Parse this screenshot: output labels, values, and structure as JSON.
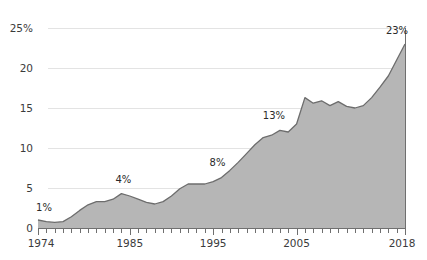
{
  "chart_data": {
    "type": "area",
    "title": "",
    "subtitle": "",
    "xlabel": "",
    "ylabel": "",
    "xlim": [
      1974,
      2018
    ],
    "ylim": [
      0,
      25
    ],
    "grid": true,
    "legend_position": "none",
    "y_ticks": [
      0,
      5,
      10,
      15,
      20,
      25
    ],
    "y_tick_labels": [
      "0",
      "5",
      "10",
      "15",
      "20",
      "25%"
    ],
    "x_tick_labels": [
      "1974",
      "1985",
      "1995",
      "2005",
      "2018"
    ],
    "x_tick_values": [
      1974,
      1985,
      1995,
      2005,
      2018
    ],
    "minor_tick_interval": 1,
    "series": [
      {
        "name": "value",
        "x": [
          1974,
          1975,
          1976,
          1977,
          1978,
          1979,
          1980,
          1981,
          1982,
          1983,
          1984,
          1985,
          1986,
          1987,
          1988,
          1989,
          1990,
          1991,
          1992,
          1993,
          1994,
          1995,
          1996,
          1997,
          1998,
          1999,
          2000,
          2001,
          2002,
          2003,
          2004,
          2005,
          2006,
          2007,
          2008,
          2009,
          2010,
          2011,
          2012,
          2013,
          2014,
          2015,
          2016,
          2017,
          2018
        ],
        "values": [
          1.0,
          0.8,
          0.7,
          0.8,
          1.4,
          2.2,
          2.9,
          3.3,
          3.3,
          3.6,
          4.3,
          4.0,
          3.6,
          3.2,
          3.0,
          3.3,
          4.0,
          4.9,
          5.5,
          5.5,
          5.5,
          5.8,
          6.3,
          7.2,
          8.2,
          9.3,
          10.4,
          11.3,
          11.6,
          12.2,
          12.0,
          13.0,
          16.3,
          15.6,
          15.9,
          15.3,
          15.8,
          15.2,
          15.0,
          15.3,
          16.3,
          17.6,
          19.0,
          21.0,
          23.0
        ]
      }
    ],
    "point_labels": [
      {
        "text": "1%",
        "x": 1974,
        "value": 1.0
      },
      {
        "text": "4%",
        "x": 1984,
        "value": 4.3
      },
      {
        "text": "8%",
        "x": 1996,
        "value": 6.3
      },
      {
        "text": "13%",
        "x": 2003,
        "value": 12.2
      },
      {
        "text": "23%",
        "x": 2018,
        "value": 23.0
      }
    ],
    "colors": {
      "area_fill": "#b6b6b6",
      "area_stroke": "#6d6d6d",
      "gridline": "#e3e3e3",
      "axis": "#6f6f6f",
      "tick_text": "#3b3b3b",
      "label_text": "#2a2a2a",
      "background": "#ffffff"
    }
  }
}
